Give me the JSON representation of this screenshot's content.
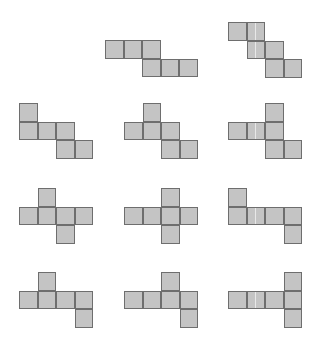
{
  "figure": {
    "title": "",
    "cell_style": {
      "fill": "#c4c4c4",
      "stroke": "#6e6e6e"
    },
    "shapes": [
      {
        "id": "net-2",
        "cells": [
          [
            0,
            0
          ],
          [
            0,
            1
          ],
          [
            0,
            2
          ],
          [
            1,
            2
          ],
          [
            1,
            3
          ],
          [
            1,
            4
          ]
        ]
      },
      {
        "id": "net-3",
        "cells": [
          [
            0,
            0
          ],
          [
            0,
            1
          ],
          [
            1,
            1
          ],
          [
            1,
            2
          ],
          [
            2,
            2
          ],
          [
            2,
            3
          ]
        ],
        "highlight_cells": [
          [
            0,
            1
          ],
          [
            1,
            1
          ]
        ]
      },
      {
        "id": "net-4",
        "cells": [
          [
            0,
            0
          ],
          [
            1,
            0
          ],
          [
            1,
            1
          ],
          [
            1,
            2
          ],
          [
            2,
            2
          ],
          [
            2,
            3
          ]
        ]
      },
      {
        "id": "net-5",
        "cells": [
          [
            0,
            1
          ],
          [
            1,
            0
          ],
          [
            1,
            1
          ],
          [
            1,
            2
          ],
          [
            2,
            2
          ],
          [
            2,
            3
          ]
        ]
      },
      {
        "id": "net-6",
        "cells": [
          [
            0,
            2
          ],
          [
            1,
            0
          ],
          [
            1,
            1
          ],
          [
            1,
            2
          ],
          [
            2,
            2
          ],
          [
            2,
            3
          ]
        ],
        "highlight_cells": [
          [
            1,
            1
          ]
        ]
      },
      {
        "id": "net-7",
        "cells": [
          [
            0,
            1
          ],
          [
            1,
            0
          ],
          [
            1,
            1
          ],
          [
            1,
            2
          ],
          [
            1,
            3
          ],
          [
            2,
            2
          ]
        ]
      },
      {
        "id": "net-8",
        "cells": [
          [
            0,
            2
          ],
          [
            1,
            0
          ],
          [
            1,
            1
          ],
          [
            1,
            2
          ],
          [
            1,
            3
          ],
          [
            2,
            2
          ]
        ]
      },
      {
        "id": "net-9",
        "cells": [
          [
            0,
            0
          ],
          [
            1,
            0
          ],
          [
            1,
            1
          ],
          [
            1,
            2
          ],
          [
            1,
            3
          ],
          [
            2,
            3
          ]
        ],
        "highlight_cells": [
          [
            1,
            1
          ]
        ]
      },
      {
        "id": "net-10",
        "cells": [
          [
            0,
            1
          ],
          [
            1,
            0
          ],
          [
            1,
            1
          ],
          [
            1,
            2
          ],
          [
            1,
            3
          ],
          [
            2,
            3
          ]
        ]
      },
      {
        "id": "net-11",
        "cells": [
          [
            0,
            2
          ],
          [
            1,
            0
          ],
          [
            1,
            1
          ],
          [
            1,
            2
          ],
          [
            1,
            3
          ],
          [
            2,
            3
          ]
        ]
      },
      {
        "id": "net-12",
        "cells": [
          [
            0,
            3
          ],
          [
            1,
            0
          ],
          [
            1,
            1
          ],
          [
            1,
            2
          ],
          [
            1,
            3
          ],
          [
            2,
            3
          ]
        ],
        "highlight_cells": [
          [
            1,
            1
          ]
        ]
      }
    ]
  }
}
